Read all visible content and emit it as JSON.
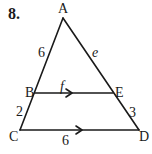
{
  "problem_number": "8.",
  "vertices": {
    "A": {
      "label": "A",
      "x": 63,
      "y": 18
    },
    "B": {
      "label": "B",
      "x": 35,
      "y": 93
    },
    "C": {
      "label": "C",
      "x": 20,
      "y": 130
    },
    "D": {
      "label": "D",
      "x": 139,
      "y": 130
    },
    "E": {
      "label": "E",
      "x": 113,
      "y": 93
    }
  },
  "segment_labels": {
    "AB": "6",
    "AE": "e",
    "BE": "f",
    "BC": "2",
    "ED": "3",
    "CD": "6"
  },
  "parallel_marks": [
    "BE",
    "CD"
  ],
  "colors": {
    "stroke": "#1a1a1a",
    "background": "#ffffff"
  }
}
